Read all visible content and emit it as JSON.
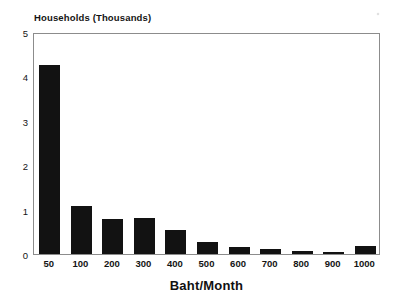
{
  "chart_data": {
    "type": "bar",
    "title": "",
    "subtitle": "",
    "xlabel": "Baht/Month",
    "ylabel": "Households (Thousands)",
    "categories": [
      "50",
      "100",
      "200",
      "300",
      "400",
      "500",
      "600",
      "700",
      "800",
      "900",
      "1000"
    ],
    "values": [
      4.25,
      1.08,
      0.79,
      0.8,
      0.53,
      0.28,
      0.15,
      0.11,
      0.06,
      0.04,
      0.17
    ],
    "series": [
      {
        "name": "Households",
        "values": [
          4.25,
          1.08,
          0.79,
          0.8,
          0.53,
          0.28,
          0.15,
          0.11,
          0.06,
          0.04,
          0.17
        ]
      }
    ],
    "ylim": [
      0,
      5
    ],
    "yticks": [
      0,
      1,
      2,
      3,
      4,
      5
    ],
    "ytick_labels": [
      "0",
      "1",
      "2",
      "3",
      "4",
      "5"
    ],
    "xtick_labels": [
      "50",
      "100",
      "200",
      "300",
      "400",
      "500",
      "600",
      "700",
      "800",
      "900",
      "1000"
    ],
    "grid": false,
    "legend": null,
    "legend_position": "none",
    "bar_color": "#121212",
    "axis_color": "#8c8c8c",
    "background_color": "#ffffff",
    "annotations": []
  },
  "axes": {
    "y_title": "Households (Thousands)",
    "x_title": "Baht/Month"
  }
}
